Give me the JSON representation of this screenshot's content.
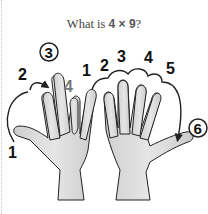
{
  "title": {
    "prefix": "What is ",
    "expression": "4 × 9",
    "suffix": "?"
  },
  "left_hand": {
    "labels": {
      "thumb": "1",
      "index": "2",
      "middle_circled": "3",
      "ring_folded": "4",
      "pinky": "1"
    }
  },
  "right_hand": {
    "labels": {
      "finger_2": "2",
      "finger_3": "3",
      "finger_4": "4",
      "finger_5": "5",
      "thumb_circled": "6"
    }
  },
  "colors": {
    "hand_fill": "#d9d9d9",
    "outline": "#222222",
    "folded_label": "#777777",
    "text": "#111111"
  }
}
